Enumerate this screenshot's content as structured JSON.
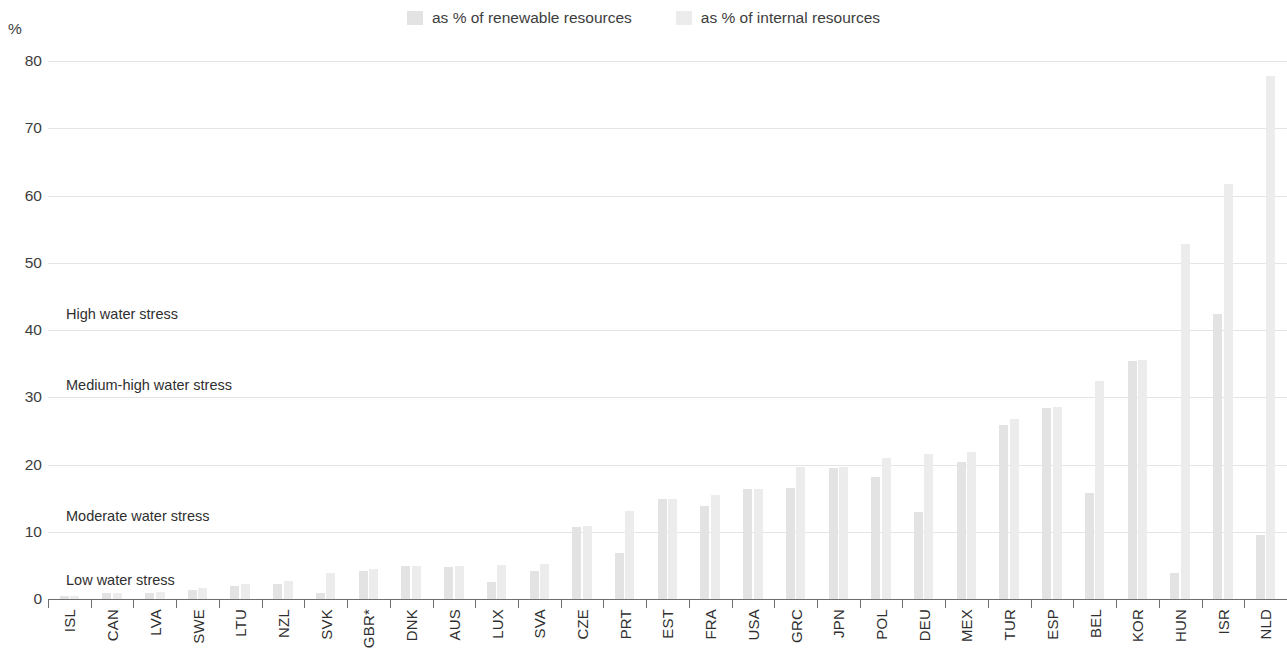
{
  "axis": {
    "unit_label": "%",
    "yticks": [
      "0",
      "10",
      "20",
      "30",
      "40",
      "50",
      "60",
      "70",
      "80"
    ]
  },
  "legend": {
    "items": [
      {
        "label": "as % of renewable resources",
        "color": "#e3e3e3",
        "icon": "legend-swatch-icon"
      },
      {
        "label": "as % of internal resources",
        "color": "#ececec",
        "icon": "legend-swatch-icon"
      }
    ]
  },
  "annotations": [
    {
      "text": "High water stress",
      "value": 43.5
    },
    {
      "text": "Medium-high water stress",
      "value": 33.0
    },
    {
      "text": "Moderate water stress",
      "value": 13.5
    },
    {
      "text": "Low water stress",
      "value": 4.0
    }
  ],
  "chart_data": {
    "type": "bar",
    "title": "",
    "xlabel": "",
    "ylabel": "%",
    "ylim": [
      0,
      80
    ],
    "ytick_step": 10,
    "grid": true,
    "legend_position": "top-center",
    "bar_color": "#e6e6e6",
    "categories": [
      "ISL",
      "CAN",
      "LVA",
      "SWE",
      "LTU",
      "NZL",
      "SVK",
      "GBR*",
      "DNK",
      "AUS",
      "LUX",
      "SVA",
      "CZE",
      "PRT",
      "EST",
      "FRA",
      "USA",
      "GRC",
      "JPN",
      "POL",
      "DEU",
      "MEX",
      "TUR",
      "ESP",
      "BEL",
      "KOR",
      "HUN",
      "ISR",
      "NLD"
    ],
    "series": [
      {
        "name": "as % of renewable resources",
        "values": [
          0.4,
          0.9,
          0.9,
          1.4,
          1.9,
          2.3,
          0.9,
          4.1,
          4.9,
          4.8,
          2.6,
          4.2,
          10.7,
          6.8,
          14.8,
          13.8,
          16.3,
          16.5,
          19.5,
          18.2,
          13.0,
          20.3,
          25.9,
          28.4,
          15.8,
          35.4,
          3.9,
          42.4,
          9.5
        ]
      },
      {
        "name": "as % of internal resources",
        "values": [
          0.4,
          0.9,
          1.0,
          1.6,
          2.2,
          2.7,
          3.8,
          4.5,
          4.9,
          4.9,
          5.1,
          5.2,
          10.8,
          13.1,
          14.8,
          15.5,
          16.4,
          19.7,
          19.6,
          21.0,
          21.6,
          21.8,
          26.8,
          28.5,
          32.4,
          35.5,
          52.8,
          61.7,
          77.8
        ]
      }
    ]
  }
}
